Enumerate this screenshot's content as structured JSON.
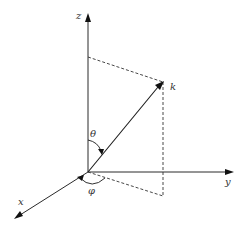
{
  "diagram": {
    "type": "spherical-coordinates",
    "labels": {
      "z_axis": "z",
      "y_axis": "y",
      "x_axis": "x",
      "vector": "k",
      "polar_angle": "θ",
      "azimuthal_angle": "φ"
    },
    "colors": {
      "line": "#1a1a1a",
      "dashed": "#333333",
      "background": "#ffffff"
    }
  }
}
